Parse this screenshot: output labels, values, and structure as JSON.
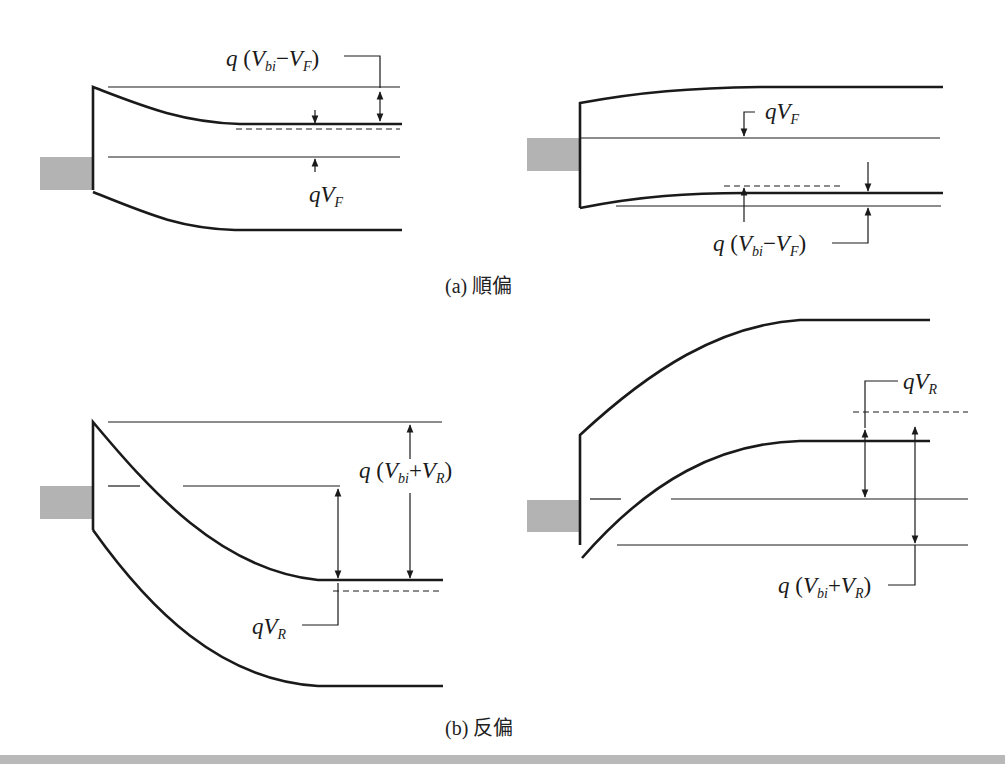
{
  "figure": {
    "type": "energy-band-diagram"
  },
  "panels": {
    "a": {
      "caption_prefix": "(a)",
      "caption_text": "順偏",
      "left": {
        "label_top": {
          "q": "q",
          "open": "(",
          "v1": "V",
          "s1": "bi",
          "op": "−",
          "v2": "V",
          "s2": "F",
          "close": ")"
        },
        "label_bottom": {
          "q": "q",
          "v": "V",
          "s": "F"
        }
      },
      "right": {
        "label_top": {
          "q": "q",
          "v": "V",
          "s": "F"
        },
        "label_bottom": {
          "q": "q",
          "open": "(",
          "v1": "V",
          "s1": "bi",
          "op": "−",
          "v2": "V",
          "s2": "F",
          "close": ")"
        }
      }
    },
    "b": {
      "caption_prefix": "(b)",
      "caption_text": "反偏",
      "left": {
        "label_barrier": {
          "q": "q",
          "open": "(",
          "v1": "V",
          "s1": "bi",
          "op": "+",
          "v2": "V",
          "s2": "R",
          "close": ")"
        },
        "label_bias": {
          "q": "q",
          "v": "V",
          "s": "R"
        }
      },
      "right": {
        "label_bias": {
          "q": "q",
          "v": "V",
          "s": "R"
        },
        "label_barrier": {
          "q": "q",
          "open": "(",
          "v1": "V",
          "s1": "bi",
          "op": "+",
          "v2": "V",
          "s2": "R",
          "close": ")"
        }
      }
    }
  },
  "colors": {
    "line": "#1a1a1a",
    "metal_fill": "#b3b3b3",
    "background": "#ffffff"
  }
}
